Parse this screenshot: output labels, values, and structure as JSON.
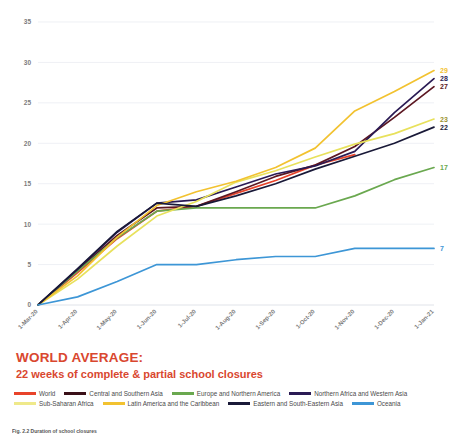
{
  "chart_data": {
    "type": "line",
    "title": "",
    "xlabel": "",
    "ylabel": "",
    "ylim": [
      0,
      35
    ],
    "yticks": [
      0,
      5,
      10,
      15,
      20,
      25,
      30,
      35
    ],
    "grid": true,
    "legend_position": "bottom",
    "x": [
      "1-Mar-20",
      "1-Apr-20",
      "1-May-20",
      "1-Jun-20",
      "1-Jul-20",
      "1-Aug-20",
      "1-Sep-20",
      "1-Oct-20",
      "1-Nov-20",
      "1-Dec-20",
      "1-Jan-21"
    ],
    "series": [
      {
        "name": "World",
        "color": "#e8432a",
        "end_label": "",
        "values": [
          0,
          4.0,
          8.2,
          11.6,
          12.2,
          13.8,
          15.4,
          17.3,
          18.6,
          null,
          null
        ]
      },
      {
        "name": "Central and Southern Asia",
        "color": "#5c1722",
        "end_label": "27",
        "values": [
          0,
          4.3,
          8.6,
          12.0,
          12.2,
          14.0,
          15.9,
          17.3,
          19.6,
          23.2,
          27.0
        ]
      },
      {
        "name": "Europe and Northern America",
        "color": "#6aa84f",
        "end_label": "17",
        "values": [
          0,
          4.2,
          8.3,
          11.6,
          12.0,
          12.0,
          12.0,
          12.0,
          13.5,
          15.5,
          17.0
        ]
      },
      {
        "name": "Northern Africa and Western Asia",
        "color": "#2a1b54",
        "end_label": "28",
        "values": [
          0,
          4.4,
          9.0,
          12.6,
          13.0,
          14.6,
          16.2,
          17.2,
          19.0,
          23.8,
          28.0
        ]
      },
      {
        "name": "Sub-Saharan Africa",
        "color": "#e8e15c",
        "end_label": "23",
        "values": [
          0,
          3.2,
          7.3,
          11.0,
          12.8,
          15.2,
          16.6,
          18.3,
          19.9,
          21.2,
          23.0
        ]
      },
      {
        "name": "Latin America and the Caribbean",
        "color": "#f2c230",
        "end_label": "29",
        "values": [
          0,
          3.6,
          8.4,
          12.3,
          14.0,
          15.3,
          17.0,
          19.4,
          24.0,
          26.4,
          29.0
        ]
      },
      {
        "name": "Eastern and South-Eastern Asia",
        "color": "#191938",
        "end_label": "22",
        "values": [
          0,
          4.5,
          9.1,
          12.6,
          12.2,
          13.5,
          15.0,
          16.8,
          18.4,
          20.0,
          22.0
        ]
      },
      {
        "name": "Oceania",
        "color": "#3d96d6",
        "end_label": "7",
        "values": [
          0,
          1.0,
          2.9,
          5.0,
          5.0,
          5.6,
          6.0,
          6.0,
          7.0,
          7.0,
          7.0
        ]
      }
    ]
  },
  "title_block": {
    "main": "WORLD AVERAGE:",
    "sub": "22 weeks of complete & partial school closures",
    "color": "#d9472f"
  },
  "legend": {
    "row1": [
      {
        "label": "World",
        "color": "#e8432a"
      },
      {
        "label": "Central and Southern Asia",
        "color": "#3a1018"
      },
      {
        "label": "Europe and Northern America",
        "color": "#6aa84f"
      },
      {
        "label": "Northern Africa and Western Asia",
        "color": "#2a1b54"
      }
    ],
    "row2": [
      {
        "label": "Sub-Saharan Africa",
        "color": "#efe98a"
      },
      {
        "label": "Latin America and the Caribbean",
        "color": "#f2c230"
      },
      {
        "label": "Eastern and South-Eastern Asia",
        "color": "#191938"
      },
      {
        "label": "Oceania",
        "color": "#3d96d6"
      }
    ]
  },
  "footer": {
    "caption": "Fig. 2.2  Duration of school closures"
  }
}
